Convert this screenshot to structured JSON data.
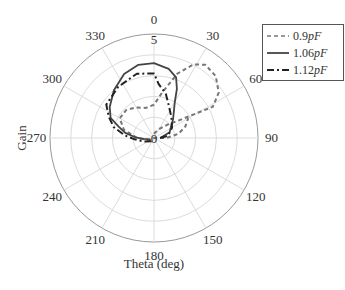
{
  "chart_data": {
    "type": "polar-line",
    "title": "",
    "xlabel": "Theta (deg)",
    "ylabel": "Gain",
    "theta_direction": "clockwise",
    "theta_zero_location": "top",
    "angle_ticks": [
      "0",
      "30",
      "60",
      "90",
      "120",
      "150",
      "180",
      "210",
      "240",
      "270",
      "300",
      "330"
    ],
    "radial_ticks": [
      "0",
      "5"
    ],
    "rlim": [
      0,
      5
    ],
    "grid": true,
    "legend_position": "upper right (outside)",
    "series": [
      {
        "name": "0.9pF",
        "style": "dashed",
        "color": "#777777",
        "points_theta_deg_r": [
          [
            0,
            0.2
          ],
          [
            15,
            0.3
          ],
          [
            30,
            0.5
          ],
          [
            45,
            0.9
          ],
          [
            55,
            1.5
          ],
          [
            60,
            2.4
          ],
          [
            62,
            3.2
          ],
          [
            55,
            3.8
          ],
          [
            45,
            4.2
          ],
          [
            35,
            4.3
          ],
          [
            28,
            4.0
          ],
          [
            20,
            3.3
          ],
          [
            10,
            2.2
          ],
          [
            0,
            1.6
          ],
          [
            -15,
            1.5
          ],
          [
            -30,
            1.7
          ],
          [
            -45,
            1.9
          ],
          [
            -60,
            1.9
          ],
          [
            -75,
            1.5
          ],
          [
            -90,
            0.8
          ],
          [
            -110,
            0.3
          ],
          [
            -140,
            0.1
          ],
          [
            180,
            0
          ],
          [
            90,
            0.6
          ],
          [
            80,
            1.2
          ],
          [
            70,
            1.6
          ],
          [
            60,
            1.9
          ]
        ]
      },
      {
        "name": "1.06pF",
        "style": "solid",
        "color": "#444444",
        "points_theta_deg_r": [
          [
            90,
            0.3
          ],
          [
            70,
            0.8
          ],
          [
            45,
            1.3
          ],
          [
            30,
            2.0
          ],
          [
            25,
            2.6
          ],
          [
            20,
            3.1
          ],
          [
            12,
            3.4
          ],
          [
            0,
            3.6
          ],
          [
            -12,
            3.6
          ],
          [
            -25,
            3.4
          ],
          [
            -40,
            3.0
          ],
          [
            -55,
            2.6
          ],
          [
            -65,
            2.3
          ],
          [
            -72,
            1.8
          ],
          [
            -80,
            1.4
          ],
          [
            -88,
            0.9
          ],
          [
            -95,
            0.5
          ],
          [
            -110,
            0.2
          ]
        ]
      },
      {
        "name": "1.12pF",
        "style": "dashdot",
        "color": "#222222",
        "points_theta_deg_r": [
          [
            90,
            0.3
          ],
          [
            80,
            0.7
          ],
          [
            60,
            1.0
          ],
          [
            40,
            1.3
          ],
          [
            25,
            1.7
          ],
          [
            15,
            2.2
          ],
          [
            5,
            2.6
          ],
          [
            0,
            3.1
          ],
          [
            -15,
            3.2
          ],
          [
            -35,
            3.0
          ],
          [
            -55,
            2.8
          ],
          [
            -65,
            2.4
          ],
          [
            -75,
            2.0
          ],
          [
            -85,
            1.4
          ],
          [
            -95,
            0.9
          ],
          [
            -110,
            0.5
          ],
          [
            -140,
            0.2
          ],
          [
            180,
            0.1
          ]
        ]
      }
    ]
  },
  "legend": {
    "items": [
      {
        "value": "0.9",
        "unit": "pF"
      },
      {
        "value": "1.06",
        "unit": "pF"
      },
      {
        "value": "1.12",
        "unit": "pF"
      }
    ]
  },
  "labels": {
    "xlabel": "Theta (deg)",
    "ylabel": "Gain",
    "r_inner": "0",
    "r_outer": "5"
  }
}
